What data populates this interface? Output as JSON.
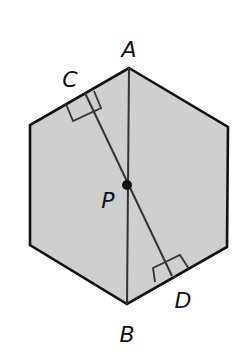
{
  "figure": {
    "shape": "regular hexagon",
    "fill_color": "#cfcfcf",
    "stroke_color": "#111111",
    "segment_color": "#333333",
    "labels": {
      "A": "A",
      "B": "B",
      "C": "C",
      "D": "D",
      "P": "P"
    },
    "segments": [
      {
        "name": "AB",
        "description": "vertical diagonal from vertex A to vertex B"
      },
      {
        "name": "CD",
        "description": "segment through P perpendicular to two opposite sides"
      }
    ],
    "right_angle_marks": [
      "C",
      "D"
    ],
    "point": "P"
  }
}
